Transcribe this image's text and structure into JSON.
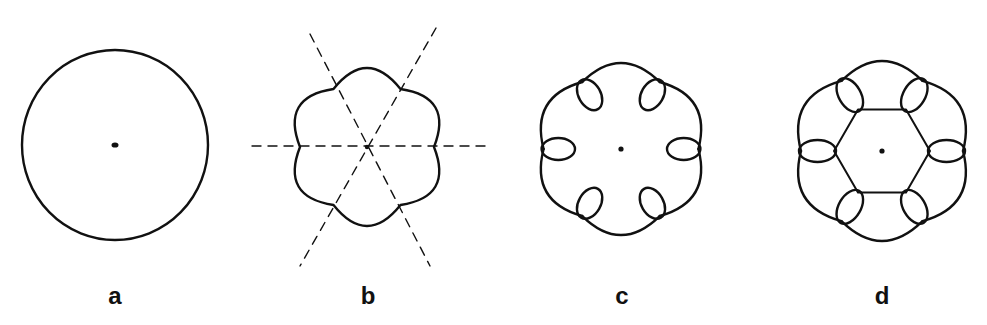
{
  "figure": {
    "panels": [
      {
        "id": "a",
        "label": "a",
        "shape": "circle",
        "description": "Plain circle with a central dot",
        "center": [
          115,
          145
        ],
        "radius": [
          93,
          95
        ],
        "label_x": 115
      },
      {
        "id": "b",
        "label": "b",
        "shape": "six-lobed flower",
        "description": "Six-lobed scalloped outline with cusps; three dashed lines through the center pass through opposite cusps",
        "center": [
          367,
          147
        ],
        "cusp_radius": 67,
        "lobe_radius": 79,
        "lobes": 6,
        "dashed_lines": 3,
        "label_x": 368
      },
      {
        "id": "c",
        "label": "c",
        "shape": "six-lobed curve with inner loops",
        "description": "Six-lobed outline; at each of the six junctions the curve forms a small inward-pointing loop; central dot",
        "center": [
          621,
          149
        ],
        "outer_radius": 86,
        "loop_inner_radius": 48,
        "loops": 6,
        "label_x": 622
      },
      {
        "id": "d",
        "label": "d",
        "shape": "six-lobed curve with loops and central hexagon",
        "description": "Same as c but the inner tips of the six loops are joined by straight segments forming a hexagon; central dot",
        "center": [
          882,
          151
        ],
        "outer_radius": 90,
        "loop_inner_radius": 48,
        "loops": 6,
        "hexagon": true,
        "label_x": 882
      }
    ],
    "stroke_color": "#111111",
    "background": "#ffffff",
    "label_y": 298
  }
}
